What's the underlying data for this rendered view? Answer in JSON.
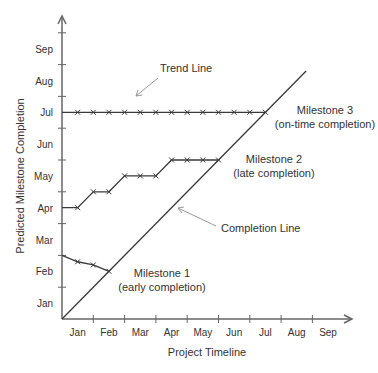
{
  "chart_data": {
    "type": "line",
    "title": "",
    "xlabel": "Project Timeline",
    "ylabel": "Predicted Milestone Completion",
    "x_tick_labels": [
      "Jan",
      "Feb",
      "Mar",
      "Apr",
      "May",
      "Jun",
      "Jul",
      "Aug",
      "Sep"
    ],
    "y_tick_labels": [
      "Jan",
      "Feb",
      "Mar",
      "Apr",
      "May",
      "Jun",
      "Jul",
      "Aug",
      "Sep"
    ],
    "xlim": [
      0,
      9
    ],
    "ylim": [
      0,
      9
    ],
    "units": "months from project start (month labels centered at n+0.5)",
    "grid": false,
    "legend": null,
    "series": [
      {
        "name": "Milestone 1 (early completion)",
        "x": [
          0,
          0.5,
          1.0,
          1.5
        ],
        "y": [
          2.0,
          1.8,
          1.7,
          1.5
        ],
        "markers": [
          false,
          true,
          true,
          true
        ]
      },
      {
        "name": "Milestone 2 (late completion)",
        "x": [
          0,
          0.5,
          1.0,
          1.5,
          2.0,
          2.5,
          3.0,
          3.5,
          4.0,
          4.5,
          5.0
        ],
        "y": [
          3.5,
          3.5,
          4.0,
          4.0,
          4.5,
          4.5,
          4.5,
          5.0,
          5.0,
          5.0,
          5.0
        ],
        "markers": [
          false,
          true,
          true,
          true,
          true,
          true,
          true,
          true,
          true,
          true,
          true
        ]
      },
      {
        "name": "Milestone 3 (on-time completion)",
        "x": [
          0,
          0.5,
          1.0,
          1.5,
          2.0,
          2.5,
          3.0,
          3.5,
          4.0,
          4.5,
          5.0,
          5.5,
          6.0,
          6.5
        ],
        "y": [
          6.5,
          6.5,
          6.5,
          6.5,
          6.5,
          6.5,
          6.5,
          6.5,
          6.5,
          6.5,
          6.5,
          6.5,
          6.5,
          6.5
        ],
        "markers": [
          false,
          true,
          true,
          true,
          true,
          true,
          true,
          true,
          true,
          true,
          true,
          true,
          true,
          true
        ]
      },
      {
        "name": "Completion Line",
        "x": [
          0,
          7.8
        ],
        "y": [
          0,
          7.8
        ],
        "markers": [
          false,
          false
        ]
      }
    ],
    "annotations": [
      {
        "text": "Trend Line",
        "arrow_to": [
          2.3,
          6.8
        ]
      },
      {
        "text": "Completion Line",
        "arrow_to": [
          3.7,
          3.5
        ]
      },
      {
        "text": "Milestone 1",
        "text2": "(early completion)"
      },
      {
        "text": "Milestone 2",
        "text2": "(late completion)"
      },
      {
        "text": "Milestone 3",
        "text2": "(on-time completion)"
      }
    ]
  },
  "labels": {
    "trend_line": "Trend Line",
    "completion_line": "Completion Line",
    "m1_title": "Milestone 1",
    "m1_sub": "(early completion)",
    "m2_title": "Milestone 2",
    "m2_sub": "(late completion)",
    "m3_title": "Milestone 3",
    "m3_sub": "(on-time completion)"
  },
  "colors": {
    "line": "#3a3a3a",
    "axis": "#666666",
    "annotation_arrow": "#999999",
    "text": "#333333"
  }
}
